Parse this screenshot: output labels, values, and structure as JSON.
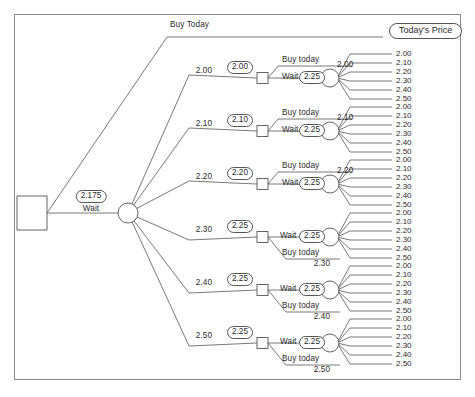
{
  "diagram": {
    "title_label": "Buy Today",
    "terminal_box_label": "Today's Price",
    "root": {
      "name": "root-decision-node",
      "wait_label": "Wait",
      "wait_value": "2.175"
    },
    "chance_branch_labels": [
      "2.00",
      "2.10",
      "2.20",
      "2.30",
      "2.40",
      "2.50"
    ],
    "stage2_values": [
      "2.00",
      "2.10",
      "2.20",
      "2.25",
      "2.25",
      "2.25"
    ],
    "buy_label": "Buy today",
    "wait_label": "Wait",
    "wait_value": "2.25",
    "outcome_values": [
      "2.00",
      "2.10",
      "2.20",
      "2.30",
      "2.40",
      "2.50"
    ],
    "rows": [
      {
        "branch": "2.00",
        "ev": "2.00",
        "order": "buy-top",
        "top_label": "Buy today",
        "bottom_label": "Wait",
        "bottom_value": "2.25",
        "chance_head": "2.00",
        "buy_payoff": ""
      },
      {
        "branch": "2.10",
        "ev": "2.10",
        "order": "buy-top",
        "top_label": "Buy today",
        "bottom_label": "Wait",
        "bottom_value": "2.25",
        "chance_head": "2.10",
        "buy_payoff": ""
      },
      {
        "branch": "2.20",
        "ev": "2.20",
        "order": "buy-top",
        "top_label": "Buy today",
        "bottom_label": "Wait",
        "bottom_value": "2.25",
        "chance_head": "2.20",
        "buy_payoff": ""
      },
      {
        "branch": "2.30",
        "ev": "2.25",
        "order": "wait-top",
        "top_label": "Wait",
        "top_value": "2.25",
        "bottom_label": "Buy today",
        "chance_head": "",
        "buy_payoff": "2.30"
      },
      {
        "branch": "2.40",
        "ev": "2.25",
        "order": "wait-top",
        "top_label": "Wait",
        "top_value": "2.25",
        "bottom_label": "Buy today",
        "chance_head": "",
        "buy_payoff": "2.40"
      },
      {
        "branch": "2.50",
        "ev": "2.25",
        "order": "wait-top",
        "top_label": "Wait",
        "top_value": "2.25",
        "bottom_label": "Buy today",
        "chance_head": "",
        "buy_payoff": "2.50"
      }
    ],
    "colors": {
      "line": "#555555",
      "text": "#2b2b2b",
      "frame": "#8a8a8a"
    }
  }
}
